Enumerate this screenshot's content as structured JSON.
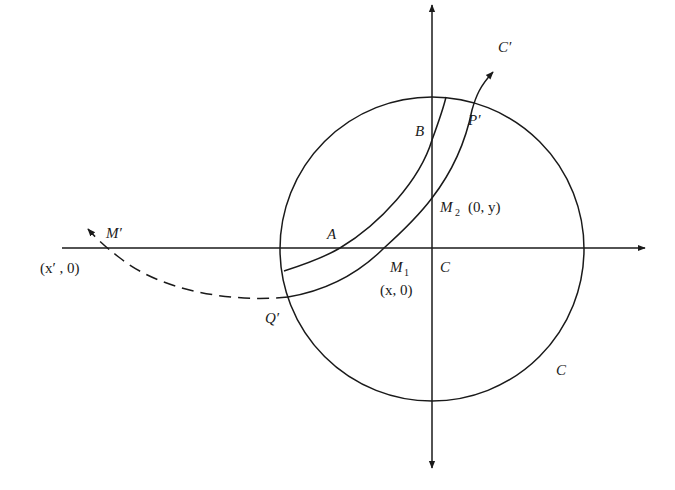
{
  "diagram": {
    "type": "geometric-construction",
    "colors": {
      "ink": "#1a1a1a",
      "background": "#ffffff"
    },
    "axes": {
      "horizontal": {
        "y": 248,
        "x_start": 62,
        "x_end": 645,
        "arrow": "right"
      },
      "vertical": {
        "x": 432,
        "y_start": 5,
        "y_end": 468,
        "arrows": [
          "up",
          "down"
        ]
      }
    },
    "circle": {
      "label": "C",
      "cx": 432,
      "cy": 249,
      "r": 152
    },
    "labels": {
      "C_prime": "C′",
      "P_prime": "P′",
      "B": "B",
      "M2": "M",
      "M2_sub": "2",
      "M2_coords": "(0,  y)",
      "A": "A",
      "M_prime": "M′",
      "x_prime_coords": "(x′ ,  0)",
      "M1": "M",
      "M1_sub": "1",
      "M1_coords": "(x,  0)",
      "C_center": "C",
      "Q_prime": "Q′",
      "circle_label": "C"
    },
    "points": [
      {
        "name": "A",
        "x": 340,
        "y": 248
      },
      {
        "name": "B",
        "x": 430,
        "y": 142
      },
      {
        "name": "M1",
        "x": 384,
        "y": 248
      },
      {
        "name": "M2",
        "x": 432,
        "y": 198
      },
      {
        "name": "C",
        "x": 432,
        "y": 248
      },
      {
        "name": "Q'",
        "x": 288,
        "y": 297
      },
      {
        "name": "P'",
        "x": 472,
        "y": 100
      },
      {
        "name": "M'",
        "x": 90,
        "y": 230
      }
    ],
    "curves": [
      {
        "name": "inner-arc-AB",
        "style": "solid",
        "from": "circle left (284,270)",
        "through": [
          "A",
          "B"
        ],
        "to": "circle top (446,97)"
      },
      {
        "name": "outer-arc-C-prime",
        "style": "solid",
        "from": "Q'",
        "through": [
          "M1",
          "M2",
          "P'"
        ],
        "to": "C' arrow"
      },
      {
        "name": "dashed-extension",
        "style": "dashed",
        "from": "Q'",
        "to": "M' arrow"
      }
    ]
  }
}
